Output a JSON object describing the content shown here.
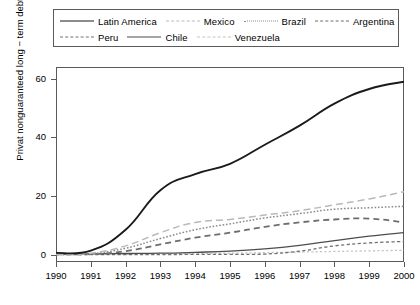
{
  "chart_data": {
    "type": "line",
    "title": "",
    "xlabel": "",
    "ylabel": "Privat nonguaranteed long − term debt ( $ Bn",
    "x": [
      1990,
      1991,
      1992,
      1993,
      1994,
      1995,
      1996,
      1997,
      1998,
      1999,
      2000
    ],
    "xtick_labels": [
      "1990",
      "1991",
      "1992",
      "1993",
      "1994",
      "1995",
      "1996",
      "1997",
      "1998",
      "1999",
      "2000"
    ],
    "ytick_labels": [
      "0",
      "20",
      "40",
      "60"
    ],
    "ytick_values": [
      0,
      20,
      40,
      60
    ],
    "xlim": [
      1990,
      2000
    ],
    "ylim": [
      -2.5,
      64
    ],
    "grid": false,
    "legend_position": "top",
    "series": [
      {
        "name": "Latin America",
        "style": "solid",
        "color": "#1a1a1a",
        "width": 1.9,
        "values": [
          0.6,
          1.4,
          8.5,
          22.0,
          27.5,
          31.0,
          37.5,
          44.0,
          51.5,
          56.5,
          59.0
        ]
      },
      {
        "name": "Mexico",
        "style": "dash-long",
        "color": "#b9b9b9",
        "width": 1.5,
        "values": [
          0.2,
          0.5,
          3.0,
          7.5,
          11.0,
          12.0,
          13.5,
          15.0,
          17.0,
          19.0,
          21.5
        ]
      },
      {
        "name": "Brazil",
        "style": "dotted",
        "color": "#8a8a8a",
        "width": 1.5,
        "values": [
          0.1,
          0.3,
          2.2,
          5.5,
          8.5,
          10.5,
          12.5,
          14.0,
          15.5,
          16.0,
          16.5
        ]
      },
      {
        "name": "Argentina",
        "style": "dash-medium",
        "color": "#6d6d6d",
        "width": 1.8,
        "values": [
          0.1,
          0.2,
          1.2,
          3.5,
          5.8,
          7.5,
          9.5,
          11.0,
          12.0,
          12.3,
          11.0
        ]
      },
      {
        "name": "Peru",
        "style": "dash-short",
        "color": "#707070",
        "width": 1.3,
        "values": [
          0.0,
          0.0,
          0.0,
          0.0,
          0.1,
          0.1,
          0.2,
          1.2,
          3.0,
          4.0,
          4.5
        ]
      },
      {
        "name": "Chile",
        "style": "solid-thin",
        "color": "#4d4d4d",
        "width": 1.3,
        "values": [
          0.2,
          0.3,
          0.4,
          0.5,
          0.8,
          1.2,
          2.0,
          3.2,
          4.8,
          6.3,
          7.5
        ]
      },
      {
        "name": "Venezuela",
        "style": "dash-dot",
        "color": "#c4c4c4",
        "width": 1.3,
        "values": [
          0.1,
          0.1,
          0.2,
          0.3,
          0.4,
          0.5,
          0.7,
          0.9,
          1.1,
          1.3,
          1.5
        ]
      }
    ]
  },
  "legend": {
    "rows": [
      [
        "Latin America",
        "Mexico",
        "Brazil",
        "Argentina"
      ],
      [
        "Peru",
        "Chile",
        "Venezuela"
      ]
    ]
  }
}
